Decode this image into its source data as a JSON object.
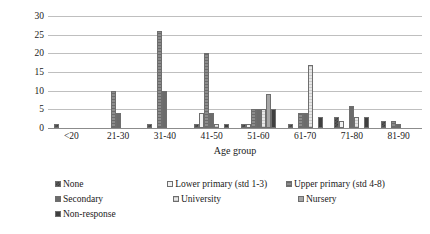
{
  "chart_data": {
    "type": "bar",
    "title": "",
    "xlabel": "Age group",
    "ylabel": "Number of respondents",
    "ylim": [
      0,
      30
    ],
    "ytick_step": 5,
    "yticks": [
      30,
      25,
      20,
      15,
      10,
      5,
      0
    ],
    "grid": true,
    "legend_position": "bottom",
    "categories": [
      "<20",
      "21-30",
      "31-40",
      "41-50",
      "51-60",
      "61-70",
      "71-80",
      "81-90"
    ],
    "series": [
      {
        "name": "None",
        "color": "#595959",
        "values": [
          1,
          0,
          1,
          1,
          1,
          1,
          3,
          2
        ]
      },
      {
        "name": "Lower primary (std 1-3)",
        "color": "#f2f2f2",
        "values": [
          0,
          0,
          0,
          4,
          1,
          0,
          2,
          0
        ]
      },
      {
        "name": "Upper primary (std 4-8)",
        "color": "#8c8c8c",
        "values": [
          0,
          10,
          26,
          20,
          5,
          4,
          0,
          2
        ]
      },
      {
        "name": "Secondary",
        "color": "#6b6b6b",
        "values": [
          0,
          4,
          10,
          4,
          5,
          4,
          6,
          1
        ]
      },
      {
        "name": "University",
        "color": "#e8e8e8",
        "values": [
          0,
          0,
          0,
          1,
          5,
          17,
          3,
          0
        ]
      },
      {
        "name": "Nursery",
        "color": "#a6a6a6",
        "values": [
          0,
          0,
          0,
          0,
          9,
          0,
          0,
          0
        ]
      },
      {
        "name": "Non-response",
        "color": "#3f3f3f",
        "values": [
          0,
          0,
          0,
          1,
          5,
          3,
          3,
          0
        ]
      }
    ]
  },
  "axes": {
    "y_title": "Number of respondents",
    "x_title": "Age group"
  },
  "legend": {
    "rows": [
      [
        {
          "label": "None",
          "series": 0
        },
        {
          "label": "Lower primary (std 1-3)",
          "series": 1
        },
        {
          "label": "Upper primary (std 4-8)",
          "series": 2
        }
      ],
      [
        {
          "label": "Secondary",
          "series": 3
        },
        {
          "label": "University",
          "series": 4
        },
        {
          "label": "Nursery",
          "series": 5
        }
      ],
      [
        {
          "label": "Non-response",
          "series": 6
        }
      ]
    ]
  }
}
